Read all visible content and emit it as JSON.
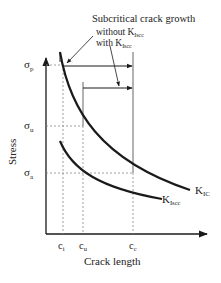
{
  "title": "Subcritical crack growth",
  "annotations": {
    "without": "without K",
    "without_sub": "Iscc",
    "with": "with K",
    "with_sub": "Iscc"
  },
  "axes": {
    "ylabel": "Stress",
    "xlabel": "Crack length"
  },
  "y_ticks": [
    {
      "sym": "σ",
      "sub": "p"
    },
    {
      "sym": "σ",
      "sub": "u"
    },
    {
      "sym": "σ",
      "sub": "a"
    }
  ],
  "x_ticks": [
    {
      "sym": "c",
      "sub": "i"
    },
    {
      "sym": "c",
      "sub": "u"
    },
    {
      "sym": "c",
      "sub": "c"
    }
  ],
  "curves": [
    {
      "name": "K",
      "sub": "IC"
    },
    {
      "name": "K",
      "sub": "Iscc"
    }
  ],
  "colors": {
    "line": "#1a1a1a",
    "dashed": "#888888"
  }
}
